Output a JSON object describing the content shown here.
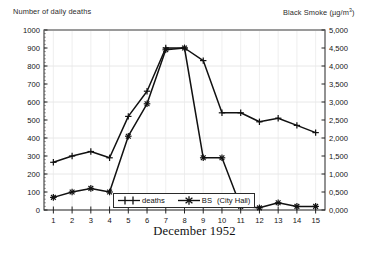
{
  "header": {
    "left_axis_label": "Number of daily deaths",
    "right_axis_label_main": "Black Smoke (",
    "right_axis_label_unit": "µg/m",
    "right_axis_label_exp": "3",
    "right_axis_label_close": ")"
  },
  "axes": {
    "x_title": "December 1952",
    "x_ticks": [
      "1",
      "2",
      "3",
      "4",
      "5",
      "6",
      "7",
      "8",
      "9",
      "10",
      "11",
      "12",
      "13",
      "14",
      "15"
    ],
    "y_left_ticks": [
      "0",
      "100",
      "200",
      "300",
      "400",
      "500",
      "600",
      "700",
      "800",
      "900",
      "1000"
    ],
    "y_right_ticks": [
      "0,000",
      "0,500",
      "1,000",
      "1,500",
      "2,000",
      "2,500",
      "3,000",
      "3,500",
      "4,000",
      "4,500",
      "5,000"
    ]
  },
  "legend": {
    "items": [
      {
        "label": "deaths",
        "marker": "plus-marker"
      },
      {
        "label": "BS",
        "sublabel": "(City Hall)",
        "marker": "asterisk-marker"
      }
    ]
  },
  "colors": {
    "line": "#111111",
    "frame": "#3a3a3a",
    "grid": "#e8e8e8",
    "background": "#ffffff"
  },
  "chart_data": {
    "type": "line",
    "title": "",
    "subtitle": "",
    "xlabel": "December 1952",
    "ylabel": "Number of daily deaths",
    "y2label": "Black Smoke (µg/m3)",
    "x": [
      1,
      2,
      3,
      4,
      5,
      6,
      7,
      8,
      9,
      10,
      11,
      12,
      13,
      14,
      15
    ],
    "xlim": [
      0.5,
      15.5
    ],
    "ylim": [
      0,
      1000
    ],
    "y2lim": [
      0,
      5000
    ],
    "grid": true,
    "legend_position": "bottom-center",
    "series": [
      {
        "name": "deaths",
        "axis": "left",
        "marker": "plus-marker",
        "values": [
          265,
          300,
          325,
          290,
          520,
          660,
          900,
          900,
          830,
          540,
          540,
          490,
          510,
          470,
          430
        ]
      },
      {
        "name": "BS (City Hall)",
        "axis": "right",
        "marker": "asterisk-marker",
        "values": [
          350,
          500,
          600,
          500,
          2050,
          2950,
          4450,
          4500,
          1450,
          1450,
          100,
          60,
          200,
          100,
          100
        ]
      }
    ],
    "annotations": []
  }
}
